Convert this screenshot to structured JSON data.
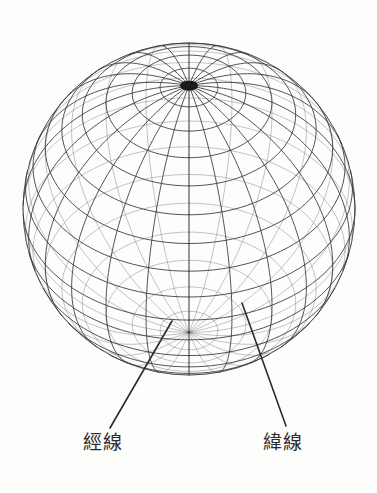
{
  "diagram": {
    "kind": "wireframe-globe",
    "background_color": "#fdfdfc",
    "line_color": "#3a3a3a",
    "text_color": "#2b2b2b",
    "sphere": {
      "center_x": 189,
      "center_y": 209,
      "radius": 166,
      "tilt_degrees": 42,
      "meridian_count": 24,
      "parallel_count": 17,
      "parallel_step_degrees": 10,
      "meridian_step_degrees": 15,
      "visible_pole": "north",
      "pole_screen_x": 183,
      "pole_screen_y": 83
    },
    "labels": [
      {
        "id": "meridian",
        "text": "經線",
        "meaning": "meridian / line of longitude",
        "text_x": 83,
        "text_y": 433,
        "leader_from_x": 110,
        "leader_from_y": 428,
        "leader_to_x": 172,
        "leader_to_y": 321
      },
      {
        "id": "parallel",
        "text": "緯線",
        "meaning": "parallel / line of latitude",
        "text_x": 263,
        "text_y": 433,
        "leader_from_x": 286,
        "leader_from_y": 426,
        "leader_to_x": 242,
        "leader_to_y": 303
      }
    ]
  },
  "chart_data": {
    "type": "diagram",
    "title": "",
    "annotations": [
      "經線",
      "緯線"
    ]
  }
}
